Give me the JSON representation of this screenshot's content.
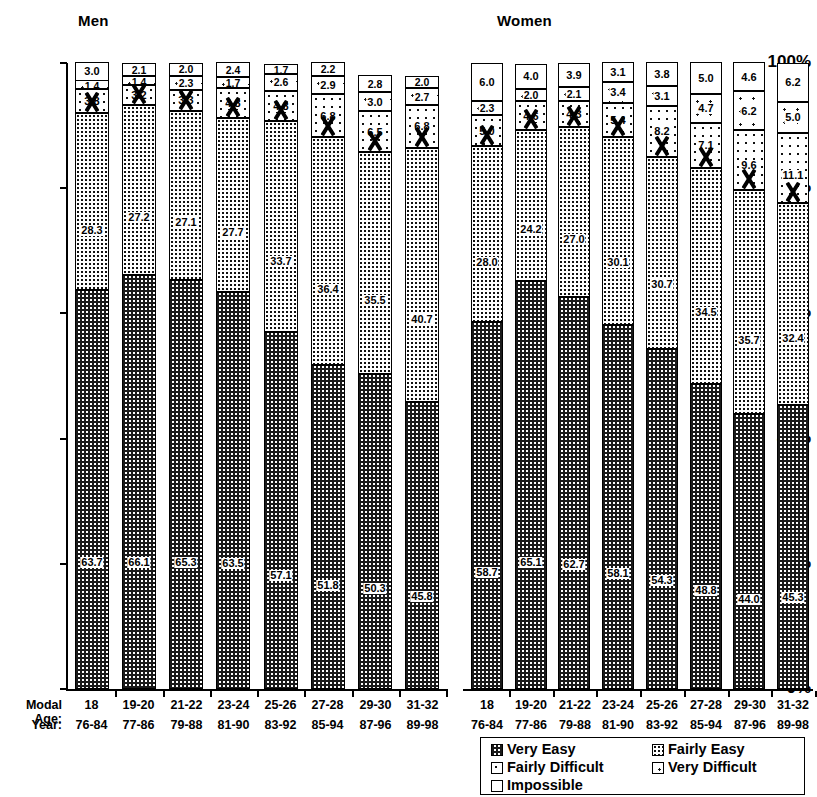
{
  "panels": [
    {
      "id": "men",
      "title": "Men"
    },
    {
      "id": "women",
      "title": "Women"
    }
  ],
  "axis": {
    "y_ticks": [
      "100%",
      "80%",
      "60%",
      "40%",
      "20%",
      "0%"
    ],
    "row_labels": {
      "modal_age": "Modal Age:",
      "year": "Year:"
    }
  },
  "legend": {
    "items": [
      {
        "key": "very_easy",
        "label": "Very Easy"
      },
      {
        "key": "fairly_easy",
        "label": "Fairly Easy"
      },
      {
        "key": "fairly_difficult",
        "label": "Fairly Difficult"
      },
      {
        "key": "very_difficult",
        "label": "Very Difficult"
      },
      {
        "key": "impossible",
        "label": "Impossible"
      }
    ]
  },
  "chart_data": {
    "type": "bar",
    "subtype": "100% stacked column, two panels",
    "title": "",
    "xlabel": "Modal Age / Year",
    "ylabel": "",
    "ylim": [
      0,
      100
    ],
    "ytick_labels": [
      "0%",
      "20%",
      "40%",
      "60%",
      "80%",
      "100%"
    ],
    "grid": false,
    "legend_position": "bottom-right",
    "categories": [
      "18",
      "19-20",
      "21-22",
      "23-24",
      "25-26",
      "27-28",
      "29-30",
      "31-32"
    ],
    "categories_year": [
      "76-84",
      "77-86",
      "79-88",
      "81-90",
      "83-92",
      "85-94",
      "87-96",
      "89-98"
    ],
    "series_order": [
      "Very Easy",
      "Fairly Easy",
      "Fairly Difficult",
      "Very Difficult",
      "Impossible"
    ],
    "panels": [
      {
        "name": "Men",
        "series": [
          {
            "name": "Very Easy",
            "values": [
              63.7,
              66.1,
              65.3,
              63.5,
              57.1,
              51.8,
              50.3,
              45.8
            ]
          },
          {
            "name": "Fairly Easy",
            "values": [
              28.3,
              27.2,
              27.1,
              27.7,
              33.7,
              36.4,
              35.5,
              40.7
            ]
          },
          {
            "name": "Fairly Difficult",
            "values": [
              3.8,
              3.2,
              3.3,
              4.8,
              4.8,
              6.8,
              6.5,
              6.8
            ]
          },
          {
            "name": "Very Difficult",
            "values": [
              1.4,
              1.4,
              2.3,
              1.7,
              2.6,
              2.9,
              3.0,
              2.7
            ]
          },
          {
            "name": "Impossible",
            "values": [
              3.0,
              2.1,
              2.0,
              2.4,
              1.7,
              2.2,
              2.8,
              2.0
            ]
          }
        ]
      },
      {
        "name": "Women",
        "series": [
          {
            "name": "Very Easy",
            "values": [
              58.7,
              65.1,
              62.7,
              58.1,
              54.3,
              48.8,
              44.0,
              45.3
            ]
          },
          {
            "name": "Fairly Easy",
            "values": [
              28.0,
              24.2,
              27.0,
              30.1,
              30.7,
              34.5,
              35.7,
              32.4
            ]
          },
          {
            "name": "Fairly Difficult",
            "values": [
              5.0,
              4.6,
              4.3,
              5.4,
              8.2,
              7.1,
              9.6,
              11.1
            ]
          },
          {
            "name": "Very Difficult",
            "values": [
              2.3,
              2.0,
              2.1,
              3.4,
              3.1,
              4.7,
              6.2,
              5.0
            ]
          },
          {
            "name": "Impossible",
            "values": [
              6.0,
              4.0,
              3.9,
              3.1,
              3.8,
              5.0,
              4.6,
              6.2
            ]
          }
        ]
      }
    ]
  }
}
